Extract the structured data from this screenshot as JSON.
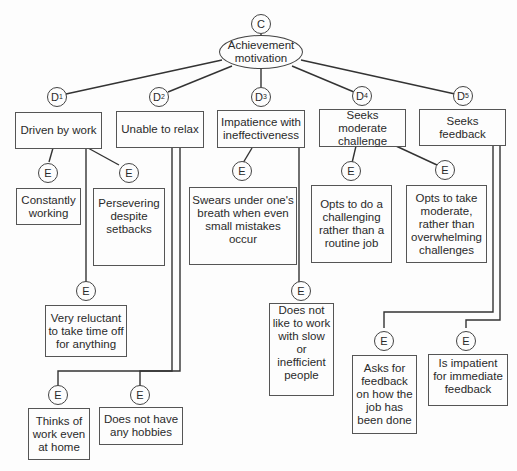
{
  "construct": {
    "tag": "C",
    "label": "Achievement motivation"
  },
  "dimensions": [
    {
      "tag": "D",
      "sub": "1",
      "label": "Driven by work"
    },
    {
      "tag": "D",
      "sub": "2",
      "label": "Unable to relax"
    },
    {
      "tag": "D",
      "sub": "3",
      "label": "Impatience with ineffectiveness"
    },
    {
      "tag": "D",
      "sub": "4",
      "label": "Seeks moderate challenge"
    },
    {
      "tag": "D",
      "sub": "5",
      "label": "Seeks feedback"
    }
  ],
  "elements": [
    {
      "tag": "E",
      "dimension": 1,
      "label": "Constantly working"
    },
    {
      "tag": "E",
      "dimension": 1,
      "label": "Persevering despite setbacks"
    },
    {
      "tag": "E",
      "dimension": 1,
      "label": "Very reluctant to take time off for anything"
    },
    {
      "tag": "E",
      "dimension": 2,
      "label": "Thinks of work even at home"
    },
    {
      "tag": "E",
      "dimension": 2,
      "label": "Does not have any hobbies"
    },
    {
      "tag": "E",
      "dimension": 3,
      "label": "Swears under one's breath when even small mistakes occur"
    },
    {
      "tag": "E",
      "dimension": 3,
      "label": "Does not like to work with slow or inefficient people"
    },
    {
      "tag": "E",
      "dimension": 4,
      "label": "Opts to do a challenging rather than a routine job"
    },
    {
      "tag": "E",
      "dimension": 4,
      "label": "Opts to take moderate, rather than overwhelming challenges"
    },
    {
      "tag": "E",
      "dimension": 5,
      "label": "Asks for feedback on how the job has been done"
    },
    {
      "tag": "E",
      "dimension": 5,
      "label": "Is impatient for immediate feedback"
    }
  ]
}
